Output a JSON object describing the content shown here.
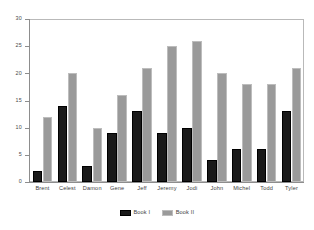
{
  "chart_data": {
    "type": "bar",
    "title": "",
    "subtitle": "",
    "xlabel": "",
    "ylabel": "",
    "categories": [
      "Brent",
      "Celest",
      "Damon",
      "Gene",
      "Jeff",
      "Jeremy",
      "Jodi",
      "John",
      "Michel",
      "Todd",
      "Tyler"
    ],
    "series": [
      {
        "name": "Book I",
        "color": "#1a1a1a",
        "values": [
          2,
          14,
          3,
          9,
          13,
          9,
          10,
          4,
          6,
          6,
          13
        ]
      },
      {
        "name": "Book II",
        "color": "#9a9a9a",
        "values": [
          12,
          20,
          10,
          16,
          21,
          25,
          26,
          20,
          18,
          18,
          21
        ]
      }
    ],
    "ylim": [
      0,
      30
    ],
    "ytick_values": [
      0,
      5,
      10,
      15,
      20,
      25,
      30
    ],
    "ytick_labels": [
      "0",
      "5",
      "10",
      "15",
      "20",
      "25",
      "30"
    ],
    "grid": false,
    "legend_position": "bottom-center",
    "annotations": []
  },
  "axes": {
    "y_tick_labels": [
      "30",
      "25",
      "20",
      "15",
      "10",
      "5",
      "0"
    ]
  },
  "legend": {
    "entries": [
      {
        "label": "Book I"
      },
      {
        "label": "Book II"
      }
    ]
  }
}
